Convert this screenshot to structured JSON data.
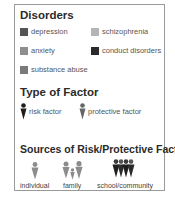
{
  "disorders": {
    "title": "Disorders",
    "items": [
      {
        "label": "depression",
        "color": "#555555"
      },
      {
        "label": "schizophrenia",
        "color": "#b5b5b5"
      },
      {
        "label": "anxiety",
        "color": "#8e8e8e"
      },
      {
        "label": "conduct disorders",
        "color": "#2a2a2a"
      },
      {
        "label": "substance abuse",
        "color": "#7a7a7a"
      }
    ]
  },
  "factor_types": {
    "title": "Type of Factor",
    "items": [
      {
        "label": "risk factor",
        "icon": "person-dark-icon",
        "color": "#1e1e1e"
      },
      {
        "label": "protective factor",
        "icon": "person-gray-icon",
        "color": "#666666"
      }
    ]
  },
  "sources": {
    "title": "Sources of Risk/Protective Factors",
    "items": [
      {
        "label": "individual",
        "icon": "single-person-icon"
      },
      {
        "label": "family",
        "icon": "family-icon"
      },
      {
        "label": "school/community",
        "icon": "group-icon"
      }
    ]
  }
}
